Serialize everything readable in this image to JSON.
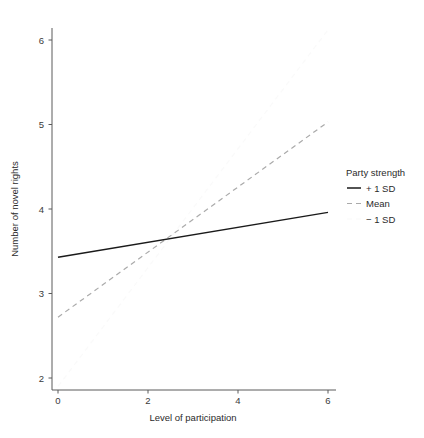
{
  "chart_data": {
    "type": "line",
    "title": "",
    "xlabel": "Level of participation",
    "ylabel": "Number of novel rights",
    "xlim": [
      -0.25,
      6.35
    ],
    "ylim": [
      1.82,
      6.28
    ],
    "xticks": [
      0,
      2,
      4,
      6
    ],
    "xtick_labels": [
      "0",
      "2",
      "4",
      "6"
    ],
    "yticks": [
      2,
      3,
      4,
      5,
      6
    ],
    "ytick_labels": [
      "2",
      "3",
      "4",
      "5",
      "6"
    ],
    "grid": false,
    "legend_position": "right",
    "legend_title": "Party strength",
    "series": [
      {
        "name": "+ 1 SD",
        "x": [
          0,
          6
        ],
        "values": [
          3.43,
          3.96
        ],
        "style": "solid",
        "color": "#1a1a1a",
        "width": 1.5,
        "dash": ""
      },
      {
        "name": "Mean",
        "x": [
          0,
          6
        ],
        "values": [
          2.72,
          5.03
        ],
        "style": "dashed",
        "color": "#aaaaaa",
        "width": 1.2,
        "dash": "5,4"
      },
      {
        "name": "− 1 SD",
        "x": [
          0,
          6
        ],
        "values": [
          1.9,
          6.12
        ],
        "style": "dashed-faint",
        "color": "#fafafa",
        "width": 1.2,
        "dash": "5,4"
      }
    ],
    "intersection": {
      "x": 2.3,
      "y": 3.65
    }
  },
  "legend": {
    "title": "Party strength",
    "entries": [
      {
        "label": "+ 1 SD"
      },
      {
        "label": "Mean"
      },
      {
        "label": "− 1 SD"
      }
    ]
  },
  "axes": {
    "x_title": "Level of participation",
    "y_title": "Number of novel rights"
  }
}
